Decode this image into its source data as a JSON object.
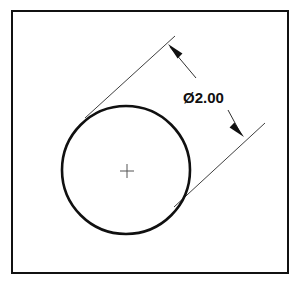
{
  "drawing": {
    "title": "Diameter dimension of circle",
    "sheet": {
      "background_color": "#ffffff",
      "border_color": "#111111",
      "border_width": 2,
      "border": {
        "x": 12,
        "y": 11,
        "width": 276,
        "height": 262
      }
    },
    "colors": {
      "object_line": "#101010",
      "dimension_line": "#303030",
      "extension_line": "#404040",
      "center_mark": "#555555",
      "text": "#101010"
    },
    "circle": {
      "label": "circle-outline",
      "center_x": 126,
      "center_y": 170,
      "radius": 64,
      "stroke_width": 2.6
    },
    "center_mark": {
      "label": "center-mark",
      "x": 127,
      "y": 171,
      "arm_length": 7,
      "stroke_width": 1
    },
    "dimension": {
      "label": "diameter-dimension",
      "symbol": "Ø",
      "value": "2.00",
      "text": "Ø2.00",
      "text_x": 183,
      "text_y": 103,
      "font_size": 15,
      "leader_angle_deg": 45,
      "line_1": {
        "x1": 170,
        "y1": 47,
        "x2": 196,
        "y2": 78
      },
      "line_2": {
        "x1": 228,
        "y1": 110,
        "x2": 241,
        "y2": 134
      },
      "arrow_1": {
        "tip_x": 168,
        "tip_y": 44,
        "direction": "up-left"
      },
      "arrow_2": {
        "tip_x": 244,
        "tip_y": 137,
        "direction": "down-right"
      }
    },
    "extension_lines": [
      {
        "label": "extension-line-upper",
        "x1": 175,
        "y1": 36,
        "x2": 85,
        "y2": 118
      },
      {
        "label": "extension-line-lower",
        "x1": 265,
        "y1": 123,
        "x2": 174,
        "y2": 207
      }
    ],
    "witness_line": {
      "label": "witness-line-through-circle",
      "x1": 175,
      "y1": 36,
      "x2": 174,
      "y2": 207
    }
  }
}
